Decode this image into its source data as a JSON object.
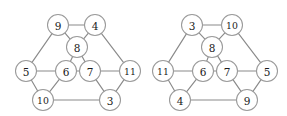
{
  "figure": {
    "width": 287,
    "height": 116,
    "background_color": "#ffffff",
    "edge_color": "#8a8a8a",
    "node_fill_color": "#ffffff",
    "node_stroke_color": "#9a9a9a",
    "label_color": "#1a1a1a",
    "node_radius": 10.5
  },
  "chart_data": {
    "type": "diagram",
    "title": "",
    "subtitle": "",
    "xlabel": "",
    "ylabel": "",
    "grid": false,
    "legend": "none",
    "graphs": [
      {
        "name": "left-graph",
        "nodes": [
          {
            "id": "tl",
            "label": "9",
            "x": 58,
            "y": 25
          },
          {
            "id": "tr",
            "label": "4",
            "x": 95,
            "y": 25
          },
          {
            "id": "hub",
            "label": "8",
            "x": 77,
            "y": 47
          },
          {
            "id": "l",
            "label": "5",
            "x": 26,
            "y": 71
          },
          {
            "id": "ml",
            "label": "6",
            "x": 66,
            "y": 71
          },
          {
            "id": "mr",
            "label": "7",
            "x": 90,
            "y": 71
          },
          {
            "id": "r",
            "label": "11",
            "x": 130,
            "y": 71
          },
          {
            "id": "bl",
            "label": "10",
            "x": 43,
            "y": 100
          },
          {
            "id": "br",
            "label": "3",
            "x": 110,
            "y": 100
          }
        ],
        "edges": [
          [
            "tl",
            "tr"
          ],
          [
            "tl",
            "hub"
          ],
          [
            "tr",
            "hub"
          ],
          [
            "tl",
            "l"
          ],
          [
            "tr",
            "r"
          ],
          [
            "hub",
            "ml"
          ],
          [
            "hub",
            "mr"
          ],
          [
            "ml",
            "mr"
          ],
          [
            "l",
            "ml"
          ],
          [
            "l",
            "bl"
          ],
          [
            "ml",
            "bl"
          ],
          [
            "mr",
            "r"
          ],
          [
            "mr",
            "br"
          ],
          [
            "r",
            "br"
          ],
          [
            "bl",
            "br"
          ]
        ]
      },
      {
        "name": "right-graph",
        "nodes": [
          {
            "id": "tl",
            "label": "3",
            "x": 192,
            "y": 25
          },
          {
            "id": "tr",
            "label": "10",
            "x": 232,
            "y": 25
          },
          {
            "id": "hub",
            "label": "8",
            "x": 212,
            "y": 47
          },
          {
            "id": "l",
            "label": "11",
            "x": 163,
            "y": 71
          },
          {
            "id": "ml",
            "label": "6",
            "x": 203,
            "y": 71
          },
          {
            "id": "mr",
            "label": "7",
            "x": 227,
            "y": 71
          },
          {
            "id": "r",
            "label": "5",
            "x": 267,
            "y": 71
          },
          {
            "id": "bl",
            "label": "4",
            "x": 180,
            "y": 100
          },
          {
            "id": "br",
            "label": "9",
            "x": 247,
            "y": 100
          }
        ],
        "edges": [
          [
            "tl",
            "tr"
          ],
          [
            "tl",
            "hub"
          ],
          [
            "tr",
            "hub"
          ],
          [
            "tl",
            "l"
          ],
          [
            "tr",
            "r"
          ],
          [
            "hub",
            "ml"
          ],
          [
            "hub",
            "mr"
          ],
          [
            "ml",
            "mr"
          ],
          [
            "l",
            "ml"
          ],
          [
            "l",
            "bl"
          ],
          [
            "ml",
            "bl"
          ],
          [
            "mr",
            "r"
          ],
          [
            "mr",
            "br"
          ],
          [
            "r",
            "br"
          ],
          [
            "bl",
            "br"
          ]
        ]
      }
    ]
  }
}
